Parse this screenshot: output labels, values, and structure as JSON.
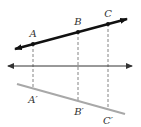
{
  "diagram": {
    "type": "reflection",
    "colors": {
      "preimage_line": "#111111",
      "image_line": "#a8a8a8",
      "axis_line": "#333333",
      "dashed": "#777777",
      "label": "#333333"
    },
    "preimage_line": {
      "x1": 15,
      "y1": 49,
      "x2": 127,
      "y2": 19,
      "arrows": "both"
    },
    "axis_line": {
      "x1": 8,
      "y1": 66,
      "x2": 132,
      "y2": 66,
      "arrows": "both"
    },
    "image_line": {
      "x1": 17,
      "y1": 84,
      "x2": 125,
      "y2": 114,
      "arrows": "none"
    },
    "points": [
      {
        "label": "A",
        "x": 33,
        "y": 44,
        "lx": 33,
        "ly": 37
      },
      {
        "label": "B",
        "x": 78,
        "y": 32,
        "lx": 78,
        "ly": 25
      },
      {
        "label": "C",
        "x": 108,
        "y": 24,
        "lx": 108,
        "ly": 17
      }
    ],
    "image_points": [
      {
        "label": "A′",
        "x": 33,
        "y": 88,
        "lx": 33,
        "ly": 103
      },
      {
        "label": "B′",
        "x": 78,
        "y": 100,
        "lx": 79,
        "ly": 115
      },
      {
        "label": "C′",
        "x": 108,
        "y": 108,
        "lx": 108,
        "ly": 124
      }
    ]
  }
}
